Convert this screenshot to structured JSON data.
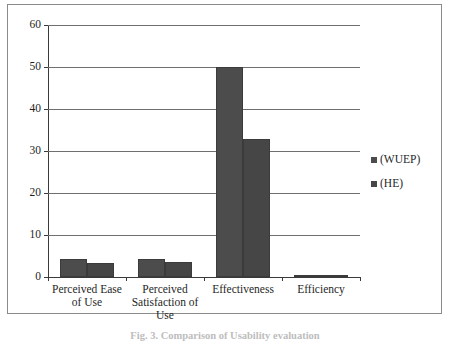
{
  "figure": {
    "caption": "Fig. 3. Comparison of Usability evaluation"
  },
  "legend": {
    "position": "right",
    "items": [
      {
        "label": "(WUEP)",
        "color": "#4c4c4c",
        "marker": "square-swatch"
      },
      {
        "label": "(HE)",
        "color": "#464646",
        "marker": "square-swatch"
      }
    ]
  },
  "axis": {
    "y_ticks": [
      "0",
      "10",
      "20",
      "30",
      "40",
      "50",
      "60"
    ]
  },
  "chart_data": {
    "type": "bar",
    "title": "",
    "subtitle": "",
    "xlabel": "",
    "ylabel": "",
    "ylim": [
      0,
      60
    ],
    "ytick_step": 10,
    "grid": true,
    "legend_position": "right",
    "categories": [
      "Perceived Ease of Use",
      "Perceived Satisfaction of Use",
      "Effectiveness",
      "Efficiency"
    ],
    "category_lines": [
      [
        "Perceived Ease",
        "of Use"
      ],
      [
        "Perceived",
        "Satisfaction of",
        "Use"
      ],
      [
        "Effectiveness"
      ],
      [
        "Efficiency"
      ]
    ],
    "series": [
      {
        "name": "(WUEP)",
        "color": "#4c4c4c",
        "values": [
          4.2,
          4.2,
          50,
          0.5
        ]
      },
      {
        "name": "(HE)",
        "color": "#464646",
        "values": [
          3.3,
          3.5,
          32.8,
          0.05
        ]
      }
    ]
  }
}
